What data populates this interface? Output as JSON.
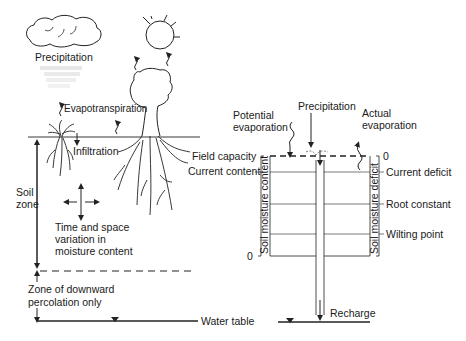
{
  "left_panel": {
    "precipitation": "Precipitation",
    "evapotranspiration": "Evapotranspiration",
    "infiltration": "Infiltration",
    "soil_zone_line1": "Soil",
    "soil_zone_line2": "zone",
    "variation_line1": "Time and space",
    "variation_line2": "variation in",
    "variation_line3": "moisture content",
    "percolation_line1": "Zone of downward",
    "percolation_line2": "percolation only",
    "water_table": "Water table"
  },
  "right_panel": {
    "potential_evap_line1": "Potential",
    "potential_evap_line2": "evaporation",
    "precipitation": "Precipitation",
    "actual_evap_line1": "Actual",
    "actual_evap_line2": "evaporation",
    "field_capacity": "Field capacity",
    "current_content": "Current content",
    "left_axis_label": "Soil moisture content",
    "left_axis_zero": "0",
    "right_axis_label": "Soil moisture deficit",
    "right_axis_zero": "0",
    "current_deficit": "Current deficit",
    "root_constant": "Root constant",
    "wilting_point": "Wilting point",
    "recharge": "Recharge"
  }
}
